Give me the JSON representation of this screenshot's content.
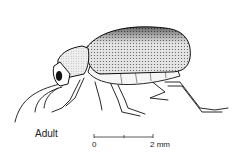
{
  "figure": {
    "caption": "Adult",
    "scale_bar": {
      "start_label": "0",
      "end_label": "2 mm"
    }
  }
}
